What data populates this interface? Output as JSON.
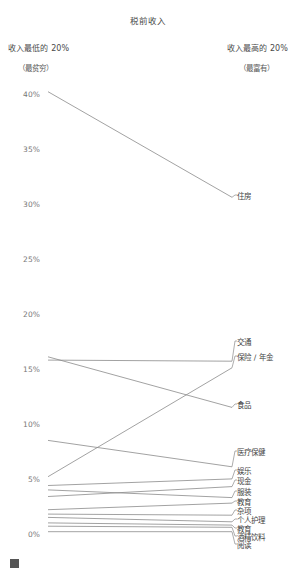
{
  "chart_data": {
    "type": "line",
    "title": "税前收入",
    "xlabel": "",
    "ylabel": "",
    "ylim": [
      0,
      42
    ],
    "grid": false,
    "legend_position": "right-labels",
    "categories": [
      "收入最低的 20%",
      "收入最高的 20%"
    ],
    "category_sublabels": [
      "（最贫穷）",
      "（最富有）"
    ],
    "ticks": [
      "0%",
      "5%",
      "10%",
      "15%",
      "20%",
      "25%",
      "30%",
      "35%",
      "40%"
    ],
    "tick_values": [
      0,
      5,
      10,
      15,
      20,
      25,
      30,
      35,
      40
    ],
    "series": [
      {
        "name": "住房",
        "values": [
          40.3,
          30.7
        ]
      },
      {
        "name": "交通",
        "values": [
          15.9,
          15.8
        ]
      },
      {
        "name": "保险 / 年金",
        "values": [
          5.3,
          15.2
        ]
      },
      {
        "name": "食品",
        "values": [
          16.2,
          11.6
        ]
      },
      {
        "name": "医疗保健",
        "values": [
          8.6,
          6.2
        ]
      },
      {
        "name": "娱乐",
        "values": [
          4.5,
          5.1
        ]
      },
      {
        "name": "现金",
        "values": [
          3.5,
          4.4
        ]
      },
      {
        "name": "服装",
        "values": [
          4.1,
          3.4
        ]
      },
      {
        "name": "教育",
        "values": [
          2.3,
          2.9
        ]
      },
      {
        "name": "杂项",
        "values": [
          1.9,
          1.8
        ]
      },
      {
        "name": "个人护理",
        "values": [
          1.6,
          1.2
        ]
      },
      {
        "name": "教育",
        "values": [
          1.1,
          0.9
        ]
      },
      {
        "name": "酒精饮料",
        "values": [
          0.8,
          0.7
        ]
      },
      {
        "name": "阅读",
        "values": [
          0.3,
          0.3
        ]
      }
    ],
    "label_positions_px": [
      195,
      341,
      356,
      404,
      451,
      470,
      480,
      491,
      501,
      510,
      519,
      528,
      536,
      544
    ],
    "line_color": "#8a8a8a",
    "text_color": "#3c3c3c"
  },
  "footer": {
    "note": ""
  }
}
